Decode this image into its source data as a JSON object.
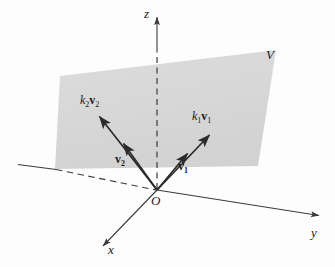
{
  "figure": {
    "type": "vector-space-diagram",
    "background_color": "#fdfdfd"
  },
  "axes": {
    "z": {
      "label": "z",
      "label_x": 144,
      "label_y": 8,
      "start_x": 157,
      "start_y": 190,
      "tip_x": 157,
      "tip_y": 14,
      "style": "solid-with-dashed-hidden-segment"
    },
    "y": {
      "label": "y",
      "label_x": 311,
      "label_y": 228,
      "start_x": 18,
      "start_y": 165,
      "tip_x": 322,
      "tip_y": 216,
      "style": "solid-with-dashed-hidden-segment"
    },
    "x": {
      "label": "x",
      "label_x": 108,
      "label_y": 246,
      "start_x": 157,
      "start_y": 190,
      "tip_x": 99,
      "tip_y": 250,
      "style": "solid"
    },
    "color": "#3b3b3b"
  },
  "origin": {
    "label": "O",
    "x": 151,
    "y": 195
  },
  "plane": {
    "label": "V",
    "label_x": 266,
    "label_y": 48,
    "fill_color": "#d9d9d9",
    "corners": [
      {
        "x": 60,
        "y": 76
      },
      {
        "x": 276,
        "y": 50
      },
      {
        "x": 258,
        "y": 166
      },
      {
        "x": 55,
        "y": 169
      }
    ]
  },
  "vectors": [
    {
      "name": "v1",
      "label": "v",
      "subscript": "1",
      "label_x": 178,
      "label_y": 160,
      "from_x": 157,
      "from_y": 190,
      "tip_x": 190,
      "tip_y": 151,
      "color": "#2b2b2b"
    },
    {
      "name": "v2",
      "label": "v",
      "subscript": "2",
      "label_x": 118,
      "label_y": 154,
      "from_x": 157,
      "from_y": 190,
      "tip_x": 121,
      "tip_y": 141,
      "color": "#2b2b2b"
    },
    {
      "name": "k1v1",
      "label_k": "k",
      "label_k_sub": "1",
      "label_v": "v",
      "label_v_sub": "1",
      "label_x": 193,
      "label_y": 110,
      "from_x": 157,
      "from_y": 190,
      "tip_x": 212,
      "tip_y": 132,
      "color": "#2b2b2b"
    },
    {
      "name": "k2v2",
      "label_k": "k",
      "label_k_sub": "2",
      "label_v": "v",
      "label_v_sub": "2",
      "label_x": 81,
      "label_y": 94,
      "from_x": 157,
      "from_y": 190,
      "tip_x": 97,
      "tip_y": 114,
      "color": "#2b2b2b"
    }
  ]
}
